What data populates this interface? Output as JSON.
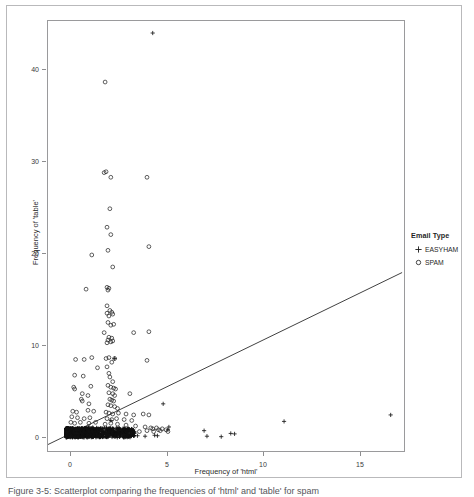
{
  "figure": {
    "caption": "Figure 3-5: Scatterplot comparing the frequencies of 'html' and 'table' for spam"
  },
  "legend": {
    "title": "Email Type",
    "entries": [
      {
        "label": "EASYHAM",
        "glyph": "plus-marker",
        "color": "#1a1a1a"
      },
      {
        "label": "SPAM",
        "glyph": "open-circle-marker",
        "color": "#1a1a1a"
      }
    ]
  },
  "chart_data": {
    "type": "scatter",
    "title": "",
    "subtitle": "",
    "xlabel": "Frequency of 'html'",
    "ylabel": "Frequency of 'table'",
    "xlim": [
      -1.2,
      17.5
    ],
    "ylim": [
      -2.0,
      44.5
    ],
    "xticks": [
      0,
      5,
      10,
      15
    ],
    "yticks": [
      0,
      10,
      20,
      30,
      40
    ],
    "grid": false,
    "legend_position": "right",
    "annotations": [
      {
        "text": "regression line (linear fit of 'table' on 'html')"
      }
    ],
    "trend_line": {
      "type": "linear",
      "label": "linear fit",
      "color": "#2b2b2b",
      "x_start": -1.2,
      "y_start": -1.3,
      "x_end": 17.4,
      "y_end": 17.3
    },
    "series": [
      {
        "name": "SPAM",
        "marker": "open-circle",
        "color": "#1a1a1a",
        "points": [
          [
            1.8,
            37.9
          ],
          [
            1.75,
            28.1
          ],
          [
            1.85,
            28.2
          ],
          [
            2.1,
            27.6
          ],
          [
            4.0,
            27.6
          ],
          [
            2.05,
            24.2
          ],
          [
            1.9,
            22.2
          ],
          [
            2.1,
            21.4
          ],
          [
            4.1,
            20.1
          ],
          [
            1.95,
            19.7
          ],
          [
            1.1,
            19.2
          ],
          [
            2.2,
            17.9
          ],
          [
            0.8,
            15.5
          ],
          [
            1.9,
            15.7
          ],
          [
            2.0,
            15.6
          ],
          [
            1.95,
            15.4
          ],
          [
            1.9,
            13.7
          ],
          [
            2.05,
            13.2
          ],
          [
            2.15,
            13.0
          ],
          [
            1.9,
            12.9
          ],
          [
            2.2,
            12.8
          ],
          [
            2.0,
            12.6
          ],
          [
            1.95,
            11.9
          ],
          [
            2.1,
            11.6
          ],
          [
            2.25,
            11.7
          ],
          [
            1.75,
            10.8
          ],
          [
            3.3,
            10.8
          ],
          [
            4.1,
            10.9
          ],
          [
            2.0,
            10.3
          ],
          [
            2.15,
            10.2
          ],
          [
            1.95,
            10.0
          ],
          [
            2.2,
            9.9
          ],
          [
            2.1,
            9.8
          ],
          [
            1.9,
            9.7
          ],
          [
            1.85,
            8.0
          ],
          [
            2.0,
            8.1
          ],
          [
            2.3,
            8.0
          ],
          [
            0.25,
            7.9
          ],
          [
            0.7,
            7.9
          ],
          [
            1.1,
            8.1
          ],
          [
            4.0,
            7.8
          ],
          [
            2.15,
            7.6
          ],
          [
            1.4,
            7.0
          ],
          [
            1.9,
            7.1
          ],
          [
            2.0,
            6.4
          ],
          [
            0.2,
            6.2
          ],
          [
            0.65,
            6.1
          ],
          [
            2.05,
            6.0
          ],
          [
            2.2,
            5.5
          ],
          [
            0.15,
            4.9
          ],
          [
            0.2,
            4.7
          ],
          [
            1.05,
            5.0
          ],
          [
            1.95,
            5.1
          ],
          [
            2.1,
            4.9
          ],
          [
            2.25,
            4.8
          ],
          [
            2.35,
            4.7
          ],
          [
            3.1,
            4.2
          ],
          [
            0.6,
            4.2
          ],
          [
            0.9,
            4.0
          ],
          [
            2.0,
            4.3
          ],
          [
            2.2,
            4.2
          ],
          [
            2.3,
            4.0
          ],
          [
            0.55,
            3.6
          ],
          [
            0.6,
            3.4
          ],
          [
            2.05,
            3.6
          ],
          [
            2.15,
            3.5
          ],
          [
            2.25,
            3.4
          ],
          [
            0.95,
            3.1
          ],
          [
            1.95,
            3.0
          ],
          [
            2.1,
            2.9
          ],
          [
            2.3,
            2.8
          ],
          [
            2.45,
            2.6
          ],
          [
            0.1,
            2.3
          ],
          [
            0.3,
            2.2
          ],
          [
            0.9,
            2.4
          ],
          [
            1.2,
            2.3
          ],
          [
            1.85,
            2.2
          ],
          [
            2.0,
            2.1
          ],
          [
            2.2,
            2.0
          ],
          [
            2.5,
            2.1
          ],
          [
            2.9,
            2.0
          ],
          [
            3.3,
            1.9
          ],
          [
            3.8,
            2.0
          ],
          [
            4.1,
            1.9
          ],
          [
            0.05,
            1.7
          ],
          [
            0.35,
            1.6
          ],
          [
            0.7,
            1.5
          ],
          [
            1.0,
            1.6
          ],
          [
            1.9,
            1.5
          ],
          [
            2.15,
            1.4
          ],
          [
            2.4,
            1.5
          ],
          [
            2.8,
            1.4
          ],
          [
            3.2,
            1.3
          ],
          [
            0.0,
            1.1
          ],
          [
            0.2,
            1.0
          ],
          [
            0.5,
            1.1
          ],
          [
            0.95,
            1.0
          ],
          [
            1.3,
            1.1
          ],
          [
            1.8,
            0.9
          ],
          [
            2.1,
            1.0
          ],
          [
            2.45,
            0.9
          ],
          [
            2.9,
            0.8
          ],
          [
            3.4,
            0.7
          ],
          [
            3.9,
            0.6
          ],
          [
            4.2,
            0.5
          ],
          [
            4.3,
            0.4
          ],
          [
            4.5,
            0.5
          ],
          [
            4.6,
            0.3
          ],
          [
            4.8,
            0.4
          ],
          [
            5.0,
            0.3
          ],
          [
            0.1,
            0.4
          ],
          [
            0.4,
            0.3
          ],
          [
            0.8,
            0.4
          ],
          [
            1.2,
            0.3
          ],
          [
            1.6,
            0.4
          ],
          [
            2.0,
            0.3
          ],
          [
            2.4,
            0.2
          ],
          [
            2.8,
            0.3
          ],
          [
            3.2,
            0.2
          ],
          [
            3.6,
            0.1
          ],
          [
            4.0,
            0.2
          ],
          [
            4.35,
            0.1
          ],
          [
            4.7,
            0.2
          ],
          [
            5.1,
            0.1
          ]
        ]
      },
      {
        "name": "EASYHAM",
        "marker": "plus",
        "color": "#1a1a1a",
        "points": [
          [
            4.3,
            43.2
          ],
          [
            2.3,
            8.0
          ],
          [
            4.85,
            3.1
          ],
          [
            16.8,
            1.9
          ],
          [
            11.2,
            1.2
          ],
          [
            2.1,
            1.3
          ],
          [
            5.15,
            0.6
          ],
          [
            5.1,
            0.3
          ],
          [
            7.0,
            0.2
          ],
          [
            7.15,
            -0.4
          ],
          [
            7.9,
            -0.45
          ],
          [
            8.4,
            -0.1
          ],
          [
            8.6,
            -0.15
          ],
          [
            3.5,
            -0.35
          ],
          [
            3.9,
            -0.4
          ],
          [
            4.4,
            -0.3
          ],
          [
            4.55,
            -0.35
          ],
          [
            0.0,
            -0.1
          ],
          [
            0.1,
            -0.15
          ],
          [
            0.2,
            -0.1
          ],
          [
            0.3,
            -0.2
          ],
          [
            0.4,
            -0.1
          ],
          [
            0.5,
            -0.15
          ],
          [
            0.6,
            -0.1
          ],
          [
            0.7,
            -0.2
          ],
          [
            0.8,
            -0.1
          ],
          [
            0.9,
            -0.15
          ],
          [
            1.0,
            -0.1
          ],
          [
            1.1,
            -0.2
          ],
          [
            1.2,
            -0.1
          ],
          [
            1.3,
            -0.15
          ],
          [
            1.4,
            -0.3
          ],
          [
            1.5,
            -0.1
          ],
          [
            1.6,
            -0.2
          ],
          [
            1.7,
            -0.15
          ],
          [
            1.8,
            -0.1
          ],
          [
            1.9,
            -0.2
          ],
          [
            2.0,
            -0.15
          ],
          [
            2.2,
            -0.3
          ],
          [
            2.4,
            -0.1
          ],
          [
            2.6,
            -0.25
          ],
          [
            2.8,
            -0.15
          ],
          [
            3.0,
            -0.3
          ],
          [
            0.05,
            0.1
          ],
          [
            0.15,
            0.05
          ],
          [
            0.25,
            0.15
          ],
          [
            0.45,
            0.1
          ],
          [
            0.65,
            0.05
          ],
          [
            0.85,
            0.12
          ],
          [
            1.05,
            0.06
          ],
          [
            1.25,
            0.14
          ],
          [
            1.45,
            0.08
          ],
          [
            1.65,
            0.1
          ],
          [
            1.85,
            0.05
          ],
          [
            2.05,
            0.12
          ],
          [
            2.25,
            0.08
          ],
          [
            2.45,
            0.1
          ],
          [
            0.95,
            0.6
          ],
          [
            1.15,
            0.55
          ],
          [
            1.35,
            0.5
          ]
        ]
      }
    ]
  },
  "axes": {
    "x": {
      "label": "Frequency of 'html'",
      "ticks": [
        "0",
        "5",
        "10",
        "15"
      ]
    },
    "y": {
      "label": "Frequency of 'table'",
      "ticks": [
        "0",
        "10",
        "20",
        "30",
        "40"
      ]
    }
  }
}
